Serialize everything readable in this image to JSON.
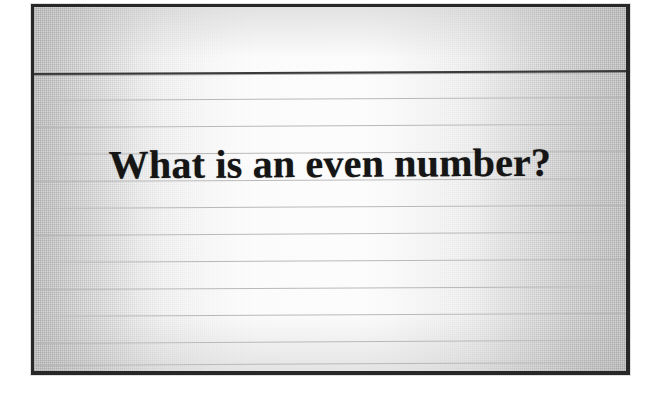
{
  "scene": {
    "background_color": "#ffffff",
    "media_type": "photograph of a ruled index card"
  },
  "card": {
    "name": "index-card",
    "border_color": "#282828",
    "paper_color_center": "#fdfdfd",
    "paper_color_edge": "#d2d2d2",
    "rule_color": "#b9b9b9",
    "header_rule_color": "#3a3a3a",
    "header_rule_y": 66,
    "rule_count": 11,
    "rule_spacing": 27,
    "rule_offsets": [
      93,
      120,
      147,
      174,
      201,
      228,
      255,
      282,
      309,
      336,
      358
    ],
    "rule_tilts": [
      -0.3,
      -0.32,
      -0.3,
      -0.28,
      -0.3,
      -0.32,
      -0.3,
      -0.28,
      -0.3,
      -0.32,
      -0.3
    ],
    "header_rule_tilt": -0.28
  },
  "content": {
    "question": "What is an even number?",
    "text_color": "#151515",
    "font_style": "serif-semibold",
    "font_size_px": 40,
    "alignment": "center"
  }
}
